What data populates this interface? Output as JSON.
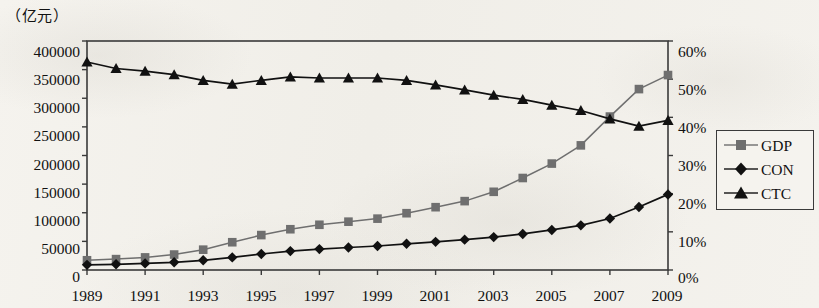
{
  "axis": {
    "unit_label": "（亿元）",
    "y_left_ticks": [
      "400000",
      "350000",
      "300000",
      "250000",
      "200000",
      "150000",
      "100000",
      "50000",
      "0"
    ],
    "y_right_ticks": [
      "60%",
      "50%",
      "40%",
      "30%",
      "20%",
      "10%",
      "0%"
    ],
    "x_ticks": [
      "1989",
      "1991",
      "1993",
      "1995",
      "1997",
      "1999",
      "2001",
      "2003",
      "2005",
      "2007",
      "2009"
    ]
  },
  "legend": {
    "items": [
      {
        "label": "GDP",
        "marker": "square-marker",
        "color": "#6f6f6f"
      },
      {
        "label": "CON",
        "marker": "diamond-marker",
        "color": "#111111"
      },
      {
        "label": "CTC",
        "marker": "triangle-marker",
        "color": "#111111"
      }
    ]
  },
  "chart_data": {
    "type": "line",
    "title": "",
    "subtitle": "",
    "xlabel": "",
    "ylabel": "（亿元）",
    "y2label": "",
    "grid": false,
    "legend_position": "right",
    "x": [
      1989,
      1990,
      1991,
      1992,
      1993,
      1994,
      1995,
      1996,
      1997,
      1998,
      1999,
      2000,
      2001,
      2002,
      2003,
      2004,
      2005,
      2006,
      2007,
      2008,
      2009
    ],
    "xlim": [
      1989,
      2009
    ],
    "ylim": [
      0,
      400000
    ],
    "y2lim": [
      0,
      0.6
    ],
    "series": [
      {
        "name": "GDP",
        "axis": "left",
        "units": "亿元",
        "marker": "square",
        "color": "#6f6f6f",
        "values": [
          17000,
          19000,
          22000,
          27000,
          35500,
          48500,
          61000,
          71200,
          79000,
          84400,
          89700,
          99200,
          109700,
          120300,
          136600,
          160700,
          185900,
          217700,
          268000,
          316000,
          340500
        ]
      },
      {
        "name": "CON",
        "axis": "left",
        "units": "亿元",
        "marker": "diamond",
        "color": "#111111",
        "values": [
          9000,
          10000,
          11500,
          13500,
          17000,
          22000,
          28000,
          33000,
          36500,
          39300,
          42000,
          45800,
          49200,
          53000,
          57500,
          63000,
          70000,
          78000,
          90000,
          110000,
          132000
        ]
      },
      {
        "name": "CTC",
        "axis": "right",
        "units": "%",
        "marker": "triangle",
        "color": "#111111",
        "values": [
          0.545,
          0.528,
          0.521,
          0.512,
          0.497,
          0.487,
          0.497,
          0.506,
          0.503,
          0.503,
          0.503,
          0.497,
          0.485,
          0.472,
          0.458,
          0.447,
          0.432,
          0.418,
          0.396,
          0.377,
          0.392
        ]
      }
    ],
    "annotations": []
  }
}
